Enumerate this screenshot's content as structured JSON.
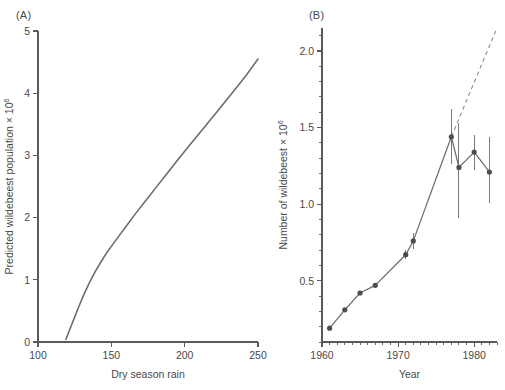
{
  "figure": {
    "panel_a_label": "(A)",
    "panel_b_label": "(B)"
  },
  "chart_data": [
    {
      "id": "panel_a",
      "type": "line",
      "title": "(A)",
      "xlabel": "Dry season rain",
      "ylabel": "Predicted wildebeest population × 10⁶",
      "ylabel_base": "Predicted wildebeest population × 10",
      "ylabel_exponent": "6",
      "xlim": [
        100,
        250
      ],
      "ylim": [
        0,
        5
      ],
      "xticks": [
        100,
        150,
        200,
        250
      ],
      "xticklabels": [
        "100",
        "150",
        "200",
        "250"
      ],
      "yticks": [
        0,
        1,
        2,
        3,
        4,
        5
      ],
      "yticklabels": [
        "0",
        "1",
        "2",
        "3",
        "4",
        "5"
      ],
      "grid": false,
      "legend": "none",
      "series": [
        {
          "name": "Predicted population vs dry season rain",
          "x": [
            119,
            122,
            125,
            128,
            131,
            135,
            139,
            143,
            147,
            151,
            156,
            161,
            167,
            173,
            180,
            188,
            196,
            205,
            214,
            224,
            234,
            242,
            250
          ],
          "y": [
            0.04,
            0.22,
            0.4,
            0.58,
            0.75,
            0.95,
            1.13,
            1.29,
            1.44,
            1.57,
            1.73,
            1.89,
            2.08,
            2.26,
            2.47,
            2.71,
            2.95,
            3.21,
            3.47,
            3.76,
            4.05,
            4.29,
            4.55
          ]
        }
      ]
    },
    {
      "id": "panel_b",
      "type": "line",
      "title": "(B)",
      "xlabel": "Year",
      "ylabel": "Number of wildebeest × 10⁶",
      "ylabel_base": "Number of wildebeest × 10",
      "ylabel_exponent": "6",
      "xlim": [
        1960,
        1983
      ],
      "ylim": [
        0.1,
        2.15
      ],
      "xticks": [
        1960,
        1970,
        1980
      ],
      "xticklabels": [
        "1960",
        "1970",
        "1980"
      ],
      "xticks_minor_step": 1,
      "yticks": [
        0.5,
        1.0,
        1.5,
        2.0
      ],
      "yticklabels": [
        "0.5",
        "1.0",
        "1.5",
        "2.0"
      ],
      "yticks_minor_step": 0.1,
      "grid": false,
      "legend": "none",
      "series": [
        {
          "name": "Observed number of wildebeest",
          "marker": "filled-circle",
          "x": [
            1961,
            1963,
            1965,
            1967,
            1971,
            1972,
            1977,
            1978,
            1980,
            1982
          ],
          "y": [
            0.19,
            0.31,
            0.42,
            0.47,
            0.67,
            0.76,
            1.44,
            1.24,
            1.34,
            1.21
          ],
          "yerr_low": [
            0.19,
            0.31,
            0.42,
            0.47,
            0.64,
            0.71,
            1.26,
            0.91,
            1.22,
            1.01
          ],
          "yerr_high": [
            0.19,
            0.31,
            0.42,
            0.47,
            0.7,
            0.81,
            1.62,
            1.53,
            1.45,
            1.44
          ]
        },
        {
          "name": "Projected (exponential) growth",
          "style": "dashed",
          "x": [
            1977,
            1983
          ],
          "y": [
            1.44,
            2.15
          ]
        }
      ]
    }
  ]
}
